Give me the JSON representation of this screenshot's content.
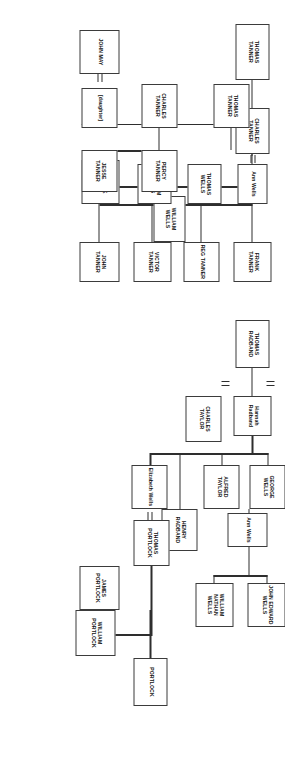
{
  "chart": {
    "type": "genealogy-tree",
    "orientation": "rotated-90-clockwise",
    "line_color": "#2e2e2e",
    "box_border_color": "#3b3b3b",
    "background": "#ffffff",
    "nodes": [
      {
        "id": "thomas-tanner-1",
        "label": "THOMAS\nTANNER",
        "case": "caps"
      },
      {
        "id": "charles-tanner-1",
        "label": "CHARLES\nTANNER",
        "case": "caps"
      },
      {
        "id": "ann-wells-1",
        "label": "Ann Wells",
        "case": "mixed"
      },
      {
        "id": "william-wells-1",
        "label": "WILLIAM\nWELLS",
        "case": "caps"
      },
      {
        "id": "thomas-wells",
        "label": "THOMAS\nWELLS",
        "case": "caps"
      },
      {
        "id": "william-wells-2",
        "label": "WILLIAM\nWELLS",
        "case": "caps"
      },
      {
        "id": "george-wells-1",
        "label": "GEORGE WELLS",
        "case": "caps"
      },
      {
        "id": "thomas-tanner-2",
        "label": "THOMAS\nTANNER",
        "case": "caps"
      },
      {
        "id": "charles-tanner-2",
        "label": "CHARLES\nTANNER",
        "case": "caps"
      },
      {
        "id": "daughter",
        "label": "[daughter]",
        "case": "mixed"
      },
      {
        "id": "john-may",
        "label": "JOHN MAY",
        "case": "caps"
      },
      {
        "id": "percy-tanner",
        "label": "PERCY TANNER",
        "case": "caps"
      },
      {
        "id": "jesse-tanner",
        "label": "JESSE TANNER",
        "case": "caps"
      },
      {
        "id": "frank-tanner",
        "label": "FRANK TANNER",
        "case": "caps"
      },
      {
        "id": "reg-tanner",
        "label": "REG TANNER",
        "case": "caps"
      },
      {
        "id": "victor-tanner",
        "label": "VICTOR\nTANNER",
        "case": "caps"
      },
      {
        "id": "john-tanner",
        "label": "JOHN TANNER",
        "case": "caps"
      },
      {
        "id": "thomas-radband",
        "label": "THOMAS\nRADBAND",
        "case": "caps"
      },
      {
        "id": "hannah-radband",
        "label": "Hannah\nRadband",
        "case": "mixed"
      },
      {
        "id": "charles-taylor",
        "label": "CHARLES\nTAYLOR",
        "case": "caps"
      },
      {
        "id": "george-wells-2",
        "label": "GEORGE WELLS",
        "case": "caps"
      },
      {
        "id": "alfred-taylor",
        "label": "ALFRED TAYLOR",
        "case": "caps"
      },
      {
        "id": "elizabeth-wells",
        "label": "Elizabeth Wells",
        "case": "mixed"
      },
      {
        "id": "henry-radband",
        "label": "HENRY\nRADBAND",
        "case": "caps"
      },
      {
        "id": "ann-wells-2",
        "label": "Ann Wells",
        "case": "mixed"
      },
      {
        "id": "john-edward-wells",
        "label": "JOHN EDWARD\nWELLS",
        "case": "caps"
      },
      {
        "id": "william-nathan-wells",
        "label": "WILLIAM\nNATHAN WELLS",
        "case": "caps"
      },
      {
        "id": "portlock",
        "label": "PORTLOCK",
        "case": "caps"
      },
      {
        "id": "thomas-portlock",
        "label": "THOMAS\nPORTLOCK",
        "case": "caps"
      },
      {
        "id": "james-portlock",
        "label": "JAMES\nPORTLOCK",
        "case": "caps"
      },
      {
        "id": "william-portlock",
        "label": "WILLIAM\nPORTLOCK",
        "case": "caps"
      }
    ],
    "marriages": [
      {
        "id": "charles-tanner-x-ann-wells",
        "between": [
          "charles-tanner-1",
          "ann-wells-1"
        ]
      },
      {
        "id": "daughter-x-john-may",
        "between": [
          "daughter",
          "john-may"
        ]
      },
      {
        "id": "george-wells-x-hannah",
        "between": [
          "george-wells-1",
          "hannah-radband"
        ]
      },
      {
        "id": "hannah-x-charles-taylor",
        "between": [
          "hannah-radband",
          "charles-taylor"
        ]
      },
      {
        "id": "elizabeth-x-thomas-portlock",
        "between": [
          "elizabeth-wells",
          "thomas-portlock"
        ]
      }
    ]
  }
}
